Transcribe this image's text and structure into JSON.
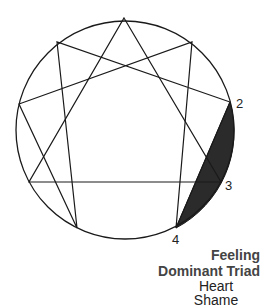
{
  "diagram": {
    "type": "enneagram",
    "points": [
      {
        "id": 9,
        "x": 124,
        "y": 18,
        "label": ""
      },
      {
        "id": 1,
        "x": 192,
        "y": 42,
        "label": ""
      },
      {
        "id": 2,
        "x": 230,
        "y": 102,
        "label": "2"
      },
      {
        "id": 3,
        "x": 221,
        "y": 182,
        "label": "3"
      },
      {
        "id": 4,
        "x": 176,
        "y": 228,
        "label": "4"
      },
      {
        "id": 5,
        "x": 77,
        "y": 228,
        "label": ""
      },
      {
        "id": 6,
        "x": 29,
        "y": 182,
        "label": ""
      },
      {
        "id": 7,
        "x": 19,
        "y": 104,
        "label": ""
      },
      {
        "id": 8,
        "x": 57,
        "y": 42,
        "label": ""
      }
    ],
    "highlight_color": "#2b2b2b",
    "line_color": "#1a1a1a"
  },
  "labels": {
    "point_2": "2",
    "point_3": "3",
    "point_4": "4",
    "triad_line1": "Feeling",
    "triad_line2": "Dominant Triad",
    "center": "Heart",
    "emotion": "Shame"
  }
}
